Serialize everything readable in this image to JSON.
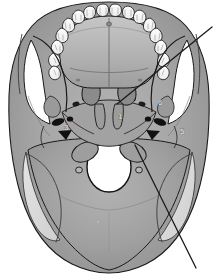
{
  "figure": {
    "rendering": "grayscale anatomical line illustration with tonal shading",
    "background_color": "#ffffff",
    "outline_color": "#1a1a1a",
    "palette": {
      "bone_light": "#e8e8e8",
      "bone_mid": "#b8b8b8",
      "bone_midtone": "#a8a8a8",
      "bone_dark": "#8f8f8f",
      "bone_shadow": "#787878",
      "foramen_black": "#111111",
      "tooth_white": "#fbfbfb",
      "occipital_pale": "#dcdcdc",
      "leader_line": "#1a1a1a"
    }
  },
  "labels": {
    "visible_numbers": [
      {
        "id": "1",
        "text": "1",
        "x": 118,
        "y": 116,
        "region": "medial pterygoid plate / vomer region"
      },
      {
        "id": "5",
        "text": "5",
        "x": 182,
        "y": 131,
        "region": "right mastoid / temporal region"
      },
      {
        "id": "6",
        "text": "6",
        "x": 160,
        "y": 102,
        "region": "right greater wing of sphenoid"
      },
      {
        "id": "3",
        "text": "3",
        "x": 66,
        "y": 127,
        "region": "left carotid canal region"
      }
    ]
  },
  "leader_lines": [
    {
      "name": "upper-right-leader",
      "from_x": 212,
      "from_y": 27,
      "to_x": 117,
      "to_y": 104,
      "description": "diagonal pointer from upper right margin to central skull base"
    },
    {
      "name": "lower-right-leader",
      "from_x": 196,
      "from_y": 268,
      "to_x": 135,
      "to_y": 145,
      "description": "diagonal pointer from lower right margin up to foramen magnum margin"
    }
  ],
  "anatomy": {
    "regions": [
      {
        "name": "maxillary-dental-arch",
        "description": "upper teeth arranged in a U-shaped arcade across the top"
      },
      {
        "name": "hard-palate",
        "description": "palatine process of maxilla and horizontal plate of palatine bone"
      },
      {
        "name": "median-palatine-suture",
        "description": "vertical midline suture of the hard palate"
      },
      {
        "name": "vomer",
        "description": "midline nasal septum bone posterior to the palate"
      },
      {
        "name": "pterygoid-plates",
        "description": "paired medial and lateral pterygoid plates of sphenoid"
      },
      {
        "name": "zygomatic-arch-left",
        "description": "left zygomatic arch with infratemporal gap"
      },
      {
        "name": "zygomatic-arch-right",
        "description": "right zygomatic arch with infratemporal gap"
      },
      {
        "name": "foramen-ovale-left",
        "description": "dark oval opening, left sphenoid"
      },
      {
        "name": "foramen-ovale-right",
        "description": "dark oval opening, right sphenoid"
      },
      {
        "name": "carotid-canal-left",
        "description": "dark rounded opening, left petrous temporal"
      },
      {
        "name": "carotid-canal-right",
        "description": "dark rounded opening, right petrous temporal"
      },
      {
        "name": "jugular-foramen-left",
        "description": "dark irregular opening, left skull base"
      },
      {
        "name": "jugular-foramen-right",
        "description": "dark irregular opening, right skull base"
      },
      {
        "name": "occipital-condyle-left",
        "description": "left condyle flanking the foramen magnum"
      },
      {
        "name": "occipital-condyle-right",
        "description": "right condyle flanking the foramen magnum"
      },
      {
        "name": "foramen-magnum",
        "description": "large white central oval opening in the occipital bone"
      },
      {
        "name": "occipital-bone",
        "description": "broad posterior shield-shaped bone"
      },
      {
        "name": "lambdoid-suture",
        "description": "irregular suture lines across the posterior occipital region"
      },
      {
        "name": "mastoid-process-left",
        "description": "left mastoid prominence"
      },
      {
        "name": "mastoid-process-right",
        "description": "right mastoid prominence"
      }
    ],
    "teeth": {
      "count": 16,
      "description": "maxillary arcade: incisors, canines, premolars and molars each side"
    }
  }
}
